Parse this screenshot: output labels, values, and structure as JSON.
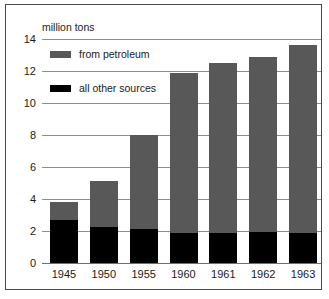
{
  "chart_data": {
    "type": "bar",
    "subtype": "stacked",
    "title": "",
    "ylabel": "million tons",
    "xlabel": "",
    "ylim": [
      0,
      14
    ],
    "ytick_values": [
      0,
      2,
      4,
      6,
      8,
      10,
      12,
      14
    ],
    "ytick_labels": [
      "0",
      "2",
      "4",
      "6",
      "8",
      "10",
      "12",
      "14"
    ],
    "grid": true,
    "legend_position": "upper-left-inside",
    "categories": [
      "1945",
      "1950",
      "1955",
      "1960",
      "1961",
      "1962",
      "1963"
    ],
    "series": [
      {
        "name": "all other sources",
        "color": "#000000",
        "values": [
          2.7,
          2.25,
          2.15,
          1.9,
          1.9,
          1.95,
          1.9
        ]
      },
      {
        "name": "from petroleum",
        "color": "#585858",
        "values": [
          1.1,
          2.85,
          5.85,
          10.0,
          10.6,
          10.95,
          11.7
        ]
      }
    ],
    "totals": [
      3.8,
      5.1,
      8.0,
      11.9,
      12.5,
      12.9,
      13.6
    ]
  },
  "legend": {
    "items": [
      {
        "label": "from petroleum",
        "color": "#585858"
      },
      {
        "label": "all other sources",
        "color": "#000000"
      }
    ]
  },
  "colors": {
    "petroleum": "#585858",
    "other_sources": "#000000",
    "gridline": "#8d8d8d",
    "frame": "#4a4a4a",
    "text": "#1a1a1a",
    "background": "#ffffff"
  }
}
